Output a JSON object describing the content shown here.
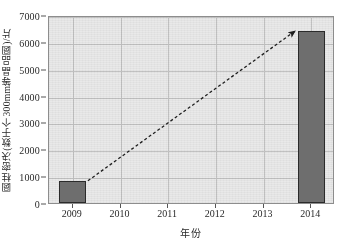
{
  "chart_data": {
    "type": "bar",
    "title": "",
    "xlabel": "年份",
    "ylabel": "圆柱密决(数于个300mm等晶品圆)/片",
    "categories": [
      "2009",
      "2010",
      "2011",
      "2012",
      "2013",
      "2014"
    ],
    "values": [
      820,
      null,
      null,
      null,
      null,
      6400
    ],
    "ylim": [
      0,
      7000
    ],
    "ytick_labels": [
      "0",
      "1000",
      "2000",
      "3000",
      "4000",
      "5000",
      "6000",
      "7000"
    ],
    "ytick_values": [
      0,
      1000,
      2000,
      3000,
      4000,
      5000,
      6000,
      7000
    ],
    "xtick_labels": [
      "2009",
      "2010",
      "2011",
      "2012",
      "2013",
      "2014"
    ],
    "grid": true,
    "legend": "none",
    "annotations": [
      {
        "type": "dashed-arrow",
        "from_category": "2009",
        "from_value": 820,
        "to_category": "2014",
        "to_value": 6400,
        "style": "dashed",
        "arrowhead": "end"
      }
    ],
    "colors": {
      "bar_fill": "#6e6e6e",
      "bar_edge": "#2b2b2b",
      "plot_background": "#e9e9e9",
      "grid": "#c2c2c2",
      "axis": "#8d8d8d",
      "trend_line": "#1e1e1e",
      "text": "#2a2a2a"
    }
  }
}
